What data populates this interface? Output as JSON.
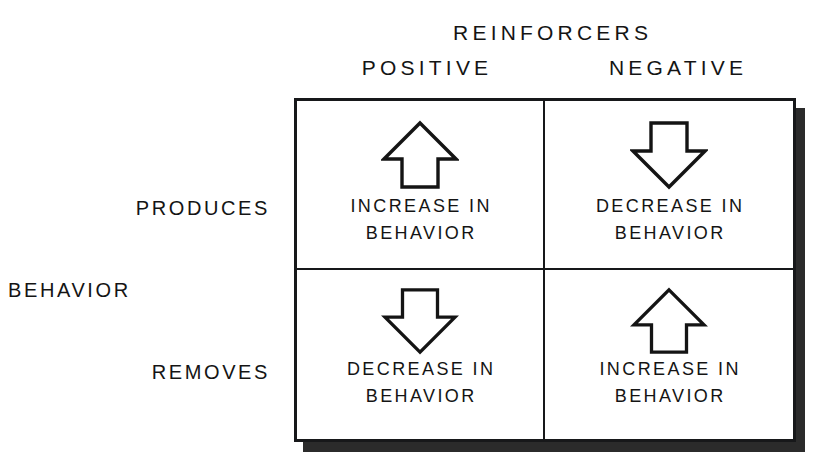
{
  "figure": {
    "column_axis_title": "REINFORCERS",
    "row_axis_title": "BEHAVIOR",
    "columns": [
      {
        "id": "positive",
        "label": "POSITIVE"
      },
      {
        "id": "negative",
        "label": "NEGATIVE"
      }
    ],
    "rows": [
      {
        "id": "produces",
        "label": "PRODUCES"
      },
      {
        "id": "removes",
        "label": "REMOVES"
      }
    ],
    "cells": [
      {
        "id": "produces-positive",
        "row": "PRODUCES",
        "column": "POSITIVE",
        "arrow": "up-arrow-icon",
        "direction": "up",
        "line1": "INCREASE IN",
        "line2": "BEHAVIOR"
      },
      {
        "id": "produces-negative",
        "row": "PRODUCES",
        "column": "NEGATIVE",
        "arrow": "down-arrow-icon",
        "direction": "down",
        "line1": "DECREASE IN",
        "line2": "BEHAVIOR"
      },
      {
        "id": "removes-positive",
        "row": "REMOVES",
        "column": "POSITIVE",
        "arrow": "down-arrow-icon",
        "direction": "down",
        "line1": "DECREASE IN",
        "line2": "BEHAVIOR"
      },
      {
        "id": "removes-negative",
        "row": "REMOVES",
        "column": "NEGATIVE",
        "arrow": "up-arrow-icon",
        "direction": "up",
        "line1": "INCREASE IN",
        "line2": "BEHAVIOR"
      }
    ],
    "colors": {
      "background": "#ffffff",
      "ink": "#141414",
      "border": "#17181a",
      "shadow": "#2b2b2b"
    }
  }
}
